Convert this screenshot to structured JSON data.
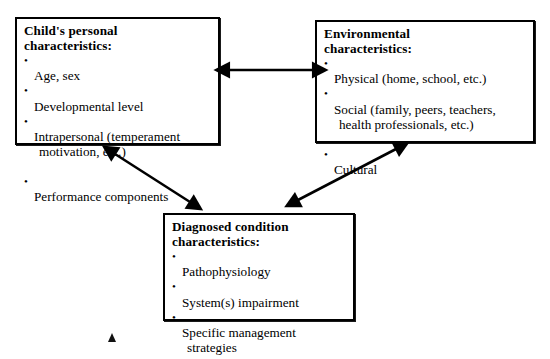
{
  "diagram": {
    "type": "concept-relationship-diagram",
    "background_color": "#ffffff",
    "line_color": "#000000",
    "boxes": [
      {
        "id": "child",
        "title": "Child's personal\ncharacteristics:",
        "bullets": [
          {
            "text": "Age, sex",
            "continuation": ""
          },
          {
            "text": "Developmental level",
            "continuation": ""
          },
          {
            "text": "Intrapersonal (temperament",
            "continuation": "motivation, etc.)"
          },
          {
            "text": "Performance components",
            "continuation": ""
          }
        ]
      },
      {
        "id": "environment",
        "title": "Environmental\ncharacteristics:",
        "bullets": [
          {
            "text": "Physical (home, school, etc.)",
            "continuation": ""
          },
          {
            "text": "Social (family, peers, teachers,",
            "continuation": "health professionals, etc.)"
          },
          {
            "text": "Cultural",
            "continuation": ""
          }
        ]
      },
      {
        "id": "diagnosed",
        "title": "Diagnosed  condition\ncharacteristics:",
        "bullets": [
          {
            "text": "Pathophysiology",
            "continuation": ""
          },
          {
            "text": "System(s) impairment",
            "continuation": ""
          },
          {
            "text": "Specific management",
            "continuation": "strategies"
          }
        ]
      }
    ],
    "connectors": [
      {
        "id": "child-environment",
        "label": "bidirectional arrow between child box and environment box",
        "style": "double-headed",
        "orientation": "horizontal"
      },
      {
        "id": "child-diagnosed",
        "label": "bidirectional arrow between child box and diagnosed condition box",
        "style": "double-headed",
        "orientation": "diagonal-down-right"
      },
      {
        "id": "environment-diagnosed",
        "label": "bidirectional arrow between diagnosed condition box and environment box",
        "style": "double-headed",
        "orientation": "diagonal-up-right"
      }
    ],
    "stray_marks": [
      {
        "id": "stray-triangle",
        "label": "small solid up-pointing triangle artifact"
      }
    ]
  }
}
